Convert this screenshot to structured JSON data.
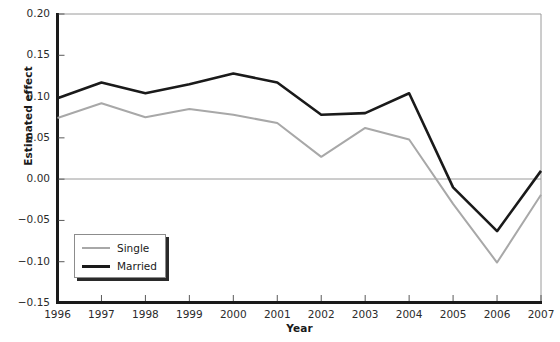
{
  "chart_data": {
    "type": "line",
    "title": "",
    "xlabel": "Year",
    "ylabel": "Estimated effect",
    "categories": [
      "1996",
      "1997",
      "1998",
      "1999",
      "2000",
      "2001",
      "2002",
      "2003",
      "2004",
      "2005",
      "2006",
      "2007"
    ],
    "x": [
      1996,
      1997,
      1998,
      1999,
      2000,
      2001,
      2002,
      2003,
      2004,
      2005,
      2006,
      2007
    ],
    "xlim": [
      1996,
      2007
    ],
    "ylim": [
      -0.15,
      0.2
    ],
    "yticks": [
      0.2,
      0.15,
      0.1,
      0.05,
      0.0,
      -0.05,
      -0.1,
      -0.15
    ],
    "ytick_labels": [
      "0.20",
      "0.15",
      "0.10",
      "0.05",
      "0.00",
      "-0.05",
      "-0.10",
      "-0.15"
    ],
    "xtick_labels": [
      "1996",
      "1997",
      "1998",
      "1999",
      "2000",
      "2001",
      "2002",
      "2003",
      "2004",
      "2005",
      "2006",
      "2007"
    ],
    "grid": false,
    "zero_line": true,
    "legend_position": "lower-left",
    "series": [
      {
        "name": "Single",
        "color": "#a8a8a8",
        "width": 2,
        "values": [
          0.074,
          0.092,
          0.075,
          0.085,
          0.078,
          0.068,
          0.027,
          0.062,
          0.048,
          -0.03,
          -0.101,
          -0.019
        ]
      },
      {
        "name": "Married",
        "color": "#1a1a1a",
        "width": 3,
        "values": [
          0.098,
          0.117,
          0.104,
          0.115,
          0.128,
          0.117,
          0.078,
          0.08,
          0.104,
          -0.01,
          -0.063,
          0.01
        ]
      }
    ]
  },
  "legend": {
    "items": [
      {
        "label": "Single"
      },
      {
        "label": "Married"
      }
    ]
  },
  "colors": {
    "single": "#a8a8a8",
    "married": "#1a1a1a",
    "axis": "#1a1a1a",
    "frame": "#9a9a9a",
    "zero_line": "#9a9a9a",
    "background": "#ffffff"
  }
}
